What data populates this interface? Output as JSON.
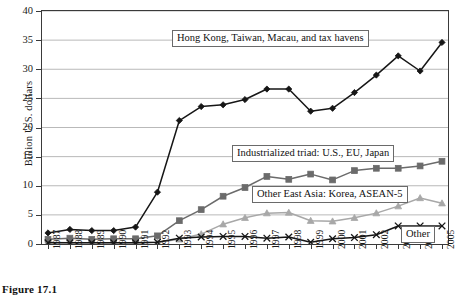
{
  "figure": {
    "caption": "Figure 17.1"
  },
  "axes": {
    "ylabel": "Billion U.S. dollars",
    "ylim": [
      0,
      40
    ],
    "yticks": [
      "0",
      "5",
      "10",
      "15",
      "20",
      "25",
      "30",
      "35",
      "40"
    ],
    "xlabel": ""
  },
  "annotations": {
    "hk_tw": "Hong Kong, Taiwan, Macau, and tax havens",
    "triad": "Industrialized triad: U.S., EU, Japan",
    "other_east_asia": "Other East Asia: Korea, ASEAN-5",
    "other": "Other"
  },
  "colors": {
    "series_hk": "#161616",
    "series_triad": "#6b6b6b",
    "series_oea": "#a8a8a8",
    "series_other": "#161616",
    "grid": "#b9b9b9",
    "axis": "#3a3a3a",
    "background": "#ffffff"
  },
  "chart_data": {
    "type": "line",
    "title": "",
    "xlabel": "",
    "ylabel": "Billion U.S. dollars",
    "ylim": [
      0,
      40
    ],
    "yticks": [
      0,
      5,
      10,
      15,
      20,
      25,
      30,
      35,
      40
    ],
    "grid": true,
    "legend": "in-plot annotation boxes",
    "categories": [
      "1987",
      "1988",
      "1989",
      "1990",
      "1991",
      "1992",
      "1993",
      "1994",
      "1995",
      "1996",
      "1997",
      "1998",
      "1999",
      "2000",
      "2001",
      "2002",
      "2003",
      "2004",
      "2005"
    ],
    "series": [
      {
        "name": "Hong Kong, Taiwan, Macau, and tax havens",
        "marker": "diamond",
        "color": "#161616",
        "values": [
          1.9,
          2.5,
          2.3,
          2.3,
          2.9,
          8.9,
          21.2,
          23.6,
          23.9,
          24.8,
          26.6,
          26.6,
          22.8,
          23.3,
          26.0,
          29.0,
          32.3,
          29.7,
          34.6
        ]
      },
      {
        "name": "Industrialized triad: U.S., EU, Japan",
        "marker": "square",
        "color": "#6b6b6b",
        "values": [
          0.8,
          1.0,
          0.8,
          0.9,
          0.9,
          1.4,
          4.0,
          5.9,
          8.2,
          9.7,
          11.6,
          11.1,
          12.0,
          11.0,
          12.6,
          13.0,
          13.0,
          13.4,
          14.2
        ]
      },
      {
        "name": "Other East Asia: Korea, ASEAN-5",
        "marker": "triangle",
        "color": "#a8a8a8",
        "values": [
          0.3,
          0.2,
          0.2,
          0.2,
          0.2,
          0.3,
          0.8,
          1.7,
          3.4,
          4.5,
          5.3,
          5.4,
          4.0,
          3.9,
          4.5,
          5.3,
          6.5,
          7.9,
          7.0
        ]
      },
      {
        "name": "Other",
        "marker": "x",
        "color": "#161616",
        "values": [
          0.2,
          0.2,
          0.2,
          0.2,
          0.2,
          0.3,
          1.0,
          1.2,
          1.3,
          1.3,
          1.0,
          1.2,
          0.3,
          0.9,
          1.1,
          1.6,
          3.1,
          3.1,
          3.1
        ]
      }
    ]
  }
}
